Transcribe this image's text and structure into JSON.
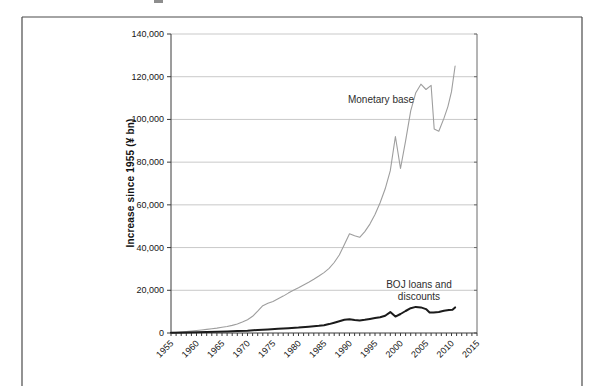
{
  "chart_data": {
    "type": "line",
    "title": "",
    "xlabel": "",
    "ylabel": "Increase since 1955 (¥ bn)",
    "xlim": [
      1955,
      2015
    ],
    "ylim": [
      0,
      140000
    ],
    "grid": "horizontal",
    "legend_position": "none (direct line labels)",
    "x_ticks_major": [
      1955,
      1960,
      1965,
      1970,
      1975,
      1980,
      1985,
      1990,
      1995,
      2000,
      2005,
      2010,
      2015
    ],
    "x_tick_labels": [
      "1955",
      "1960",
      "1965",
      "1970",
      "1975",
      "1980",
      "1985",
      "1990",
      "1995",
      "2000",
      "2005",
      "2010",
      "2015"
    ],
    "x_minor_tick_step": 1,
    "y_ticks": [
      0,
      20000,
      40000,
      60000,
      80000,
      100000,
      120000,
      140000
    ],
    "y_tick_labels": [
      "0",
      "20,000",
      "40,000",
      "60,000",
      "80,000",
      "100,000",
      "120,000",
      "140,000"
    ],
    "colors": {
      "monetary_base_line": "#9e9e9e",
      "boj_loans_line": "#1b1b1b",
      "gridline": "#c9c9c9",
      "axis": "#3a3a3a",
      "frame": "#4a4a4a"
    },
    "series": [
      {
        "name": "Monetary base",
        "color": "#9e9e9e",
        "width": 1.1,
        "points": [
          [
            1955,
            0
          ],
          [
            1956,
            200
          ],
          [
            1957,
            400
          ],
          [
            1958,
            650
          ],
          [
            1959,
            900
          ],
          [
            1960,
            1150
          ],
          [
            1961,
            1400
          ],
          [
            1962,
            1700
          ],
          [
            1963,
            2000
          ],
          [
            1964,
            2300
          ],
          [
            1965,
            2650
          ],
          [
            1966,
            3050
          ],
          [
            1967,
            3550
          ],
          [
            1968,
            4200
          ],
          [
            1969,
            5100
          ],
          [
            1970,
            6200
          ],
          [
            1971,
            7800
          ],
          [
            1972,
            10200
          ],
          [
            1973,
            12800
          ],
          [
            1974,
            13900
          ],
          [
            1975,
            14800
          ],
          [
            1976,
            16000
          ],
          [
            1977,
            17300
          ],
          [
            1978,
            18700
          ],
          [
            1979,
            20000
          ],
          [
            1980,
            21200
          ],
          [
            1981,
            22500
          ],
          [
            1982,
            23800
          ],
          [
            1983,
            25200
          ],
          [
            1984,
            26700
          ],
          [
            1985,
            28300
          ],
          [
            1986,
            30300
          ],
          [
            1987,
            33000
          ],
          [
            1988,
            36500
          ],
          [
            1989,
            41500
          ],
          [
            1990,
            46500
          ],
          [
            1991,
            45500
          ],
          [
            1992,
            44800
          ],
          [
            1993,
            47500
          ],
          [
            1994,
            51000
          ],
          [
            1995,
            55500
          ],
          [
            1996,
            61000
          ],
          [
            1997,
            67500
          ],
          [
            1998,
            76000
          ],
          [
            1999,
            92000
          ],
          [
            2000,
            77000
          ],
          [
            2001,
            90000
          ],
          [
            2002,
            104000
          ],
          [
            2003,
            112500
          ],
          [
            2004,
            116500
          ],
          [
            2005,
            114000
          ],
          [
            2006,
            116000
          ],
          [
            2006.6,
            95500
          ],
          [
            2007.5,
            94500
          ],
          [
            2008.5,
            100500
          ],
          [
            2009.3,
            106000
          ],
          [
            2010,
            113000
          ],
          [
            2010.7,
            125000
          ]
        ]
      },
      {
        "name": "BOJ loans and discounts",
        "color": "#1b1b1b",
        "width": 2,
        "points": [
          [
            1955,
            100
          ],
          [
            1958,
            250
          ],
          [
            1960,
            350
          ],
          [
            1962,
            450
          ],
          [
            1964,
            550
          ],
          [
            1966,
            700
          ],
          [
            1968,
            900
          ],
          [
            1970,
            1100
          ],
          [
            1972,
            1400
          ],
          [
            1974,
            1650
          ],
          [
            1976,
            1950
          ],
          [
            1978,
            2250
          ],
          [
            1980,
            2550
          ],
          [
            1982,
            2950
          ],
          [
            1984,
            3350
          ],
          [
            1985,
            3650
          ],
          [
            1986,
            4150
          ],
          [
            1987,
            4800
          ],
          [
            1988,
            5500
          ],
          [
            1989,
            6200
          ],
          [
            1990,
            6400
          ],
          [
            1991,
            6100
          ],
          [
            1992,
            5900
          ],
          [
            1993,
            6200
          ],
          [
            1994,
            6600
          ],
          [
            1995,
            7000
          ],
          [
            1996,
            7400
          ],
          [
            1997,
            8100
          ],
          [
            1998,
            9800
          ],
          [
            1999,
            7700
          ],
          [
            2000,
            8900
          ],
          [
            2001,
            10300
          ],
          [
            2002,
            11600
          ],
          [
            2003,
            12200
          ],
          [
            2004,
            12000
          ],
          [
            2005,
            11200
          ],
          [
            2005.7,
            9600
          ],
          [
            2006.5,
            9600
          ],
          [
            2007.5,
            9900
          ],
          [
            2008.5,
            10400
          ],
          [
            2009.5,
            10800
          ],
          [
            2010.2,
            10900
          ],
          [
            2010.7,
            12000
          ]
        ]
      }
    ],
    "annotations": [
      {
        "name": "monetary-base-label",
        "lines": [
          "Monetary base"
        ],
        "anchor": {
          "x": 1996,
          "y": 110000
        }
      },
      {
        "name": "boj-label",
        "lines": [
          "BOJ loans and",
          "discounts"
        ],
        "anchor": {
          "x": 2004,
          "y": 20000
        }
      }
    ]
  }
}
